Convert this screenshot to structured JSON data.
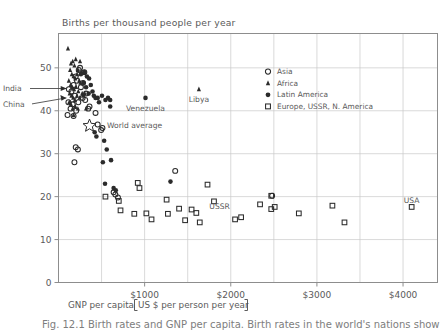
{
  "chart_data": {
    "type": "scatter",
    "title": "Births per thousand people per year",
    "ylabel": "Births per thousand people per year",
    "xlabel": "GNP per capita [US $ per person per year]",
    "xlabel_main": "GNP per capita",
    "xlabel_bracket": "US $ per person per year",
    "xlim": [
      0,
      4400
    ],
    "ylim": [
      0,
      58
    ],
    "grid": true,
    "grid_x_step": 500,
    "grid_y_step": 10,
    "legend_position": "upper-right-inside",
    "xticks": [
      0,
      1000,
      2000,
      3000,
      4000
    ],
    "xtick_labels": [
      "",
      "$1000",
      "$2000",
      "$3000",
      "$4000"
    ],
    "yticks": [
      0,
      10,
      20,
      30,
      40,
      50
    ],
    "ytick_labels": [
      "0",
      "10",
      "20",
      "30",
      "40",
      "50"
    ],
    "legend": [
      {
        "label": "Asia",
        "marker": "open-circle",
        "key": "asia"
      },
      {
        "label": "Africa",
        "marker": "filled-triangle",
        "key": "africa"
      },
      {
        "label": "Latin America",
        "marker": "filled-circle",
        "key": "latin"
      },
      {
        "label": "Europe, USSR, N. America",
        "marker": "open-square",
        "key": "europe"
      }
    ],
    "annotations": [
      {
        "text": "India",
        "x": 120,
        "y": 45.0,
        "kind": "leader-label"
      },
      {
        "text": "China",
        "x": 120,
        "y": 42.0,
        "kind": "leader-label"
      },
      {
        "text": "World average",
        "x": 470,
        "y": 36.5,
        "kind": "star-label"
      },
      {
        "text": "Venezuela",
        "x": 1010,
        "y": 43.0,
        "kind": "point-label"
      },
      {
        "text": "Libya",
        "x": 1630,
        "y": 45.0,
        "kind": "point-label"
      },
      {
        "text": "USSR",
        "x": 1870,
        "y": 17.5,
        "kind": "point-label"
      },
      {
        "text": "USA",
        "x": 4100,
        "y": 17.5,
        "kind": "point-label"
      }
    ],
    "series": [
      {
        "name": "Asia",
        "marker": "open-circle",
        "points": [
          [
            120,
            45.0
          ],
          [
            115,
            42.0
          ],
          [
            150,
            44.5
          ],
          [
            175,
            46.0
          ],
          [
            200,
            48.0
          ],
          [
            235,
            49.5
          ],
          [
            250,
            50.0
          ],
          [
            215,
            47.0
          ],
          [
            190,
            43.5
          ],
          [
            165,
            41.5
          ],
          [
            140,
            40.5
          ],
          [
            105,
            39.0
          ],
          [
            260,
            45.5
          ],
          [
            285,
            46.5
          ],
          [
            300,
            49.0
          ],
          [
            320,
            44.0
          ],
          [
            345,
            40.5
          ],
          [
            360,
            41.0
          ],
          [
            310,
            42.5
          ],
          [
            280,
            43.0
          ],
          [
            230,
            42.0
          ],
          [
            205,
            40.0
          ],
          [
            175,
            38.8
          ],
          [
            430,
            39.5
          ],
          [
            455,
            36.8
          ],
          [
            495,
            35.5
          ],
          [
            200,
            31.5
          ],
          [
            225,
            31.0
          ],
          [
            185,
            28.0
          ],
          [
            640,
            21.0
          ],
          [
            660,
            20.5
          ],
          [
            690,
            19.8
          ],
          [
            1355,
            26.0
          ],
          [
            2480,
            20.2
          ],
          [
            510,
            36.0
          ]
        ]
      },
      {
        "name": "Africa",
        "marker": "filled-triangle",
        "points": [
          [
            110,
            54.5
          ],
          [
            145,
            51.0
          ],
          [
            165,
            51.5
          ],
          [
            185,
            50.5
          ],
          [
            200,
            52.0
          ],
          [
            225,
            49.5
          ],
          [
            250,
            51.5
          ],
          [
            135,
            49.5
          ],
          [
            155,
            48.5
          ],
          [
            175,
            48.0
          ],
          [
            195,
            47.5
          ],
          [
            215,
            48.5
          ],
          [
            240,
            47.0
          ],
          [
            265,
            49.0
          ],
          [
            120,
            47.0
          ],
          [
            140,
            46.0
          ],
          [
            160,
            45.5
          ],
          [
            180,
            45.0
          ],
          [
            205,
            45.5
          ],
          [
            230,
            44.5
          ],
          [
            255,
            46.5
          ],
          [
            130,
            44.0
          ],
          [
            150,
            43.5
          ],
          [
            170,
            43.0
          ],
          [
            190,
            42.5
          ],
          [
            215,
            43.5
          ],
          [
            245,
            43.0
          ],
          [
            275,
            44.0
          ],
          [
            125,
            42.0
          ],
          [
            145,
            41.5
          ],
          [
            165,
            40.5
          ],
          [
            195,
            41.0
          ],
          [
            225,
            40.5
          ],
          [
            285,
            43.5
          ],
          [
            305,
            44.0
          ],
          [
            175,
            39.0
          ],
          [
            320,
            40.5
          ],
          [
            1630,
            45.0
          ]
        ]
      },
      {
        "name": "Latin America",
        "marker": "filled-circle",
        "points": [
          [
            260,
            48.5
          ],
          [
            300,
            49.0
          ],
          [
            330,
            48.0
          ],
          [
            355,
            47.5
          ],
          [
            375,
            46.0
          ],
          [
            395,
            44.5
          ],
          [
            410,
            43.5
          ],
          [
            350,
            44.0
          ],
          [
            320,
            45.5
          ],
          [
            290,
            46.5
          ],
          [
            430,
            43.0
          ],
          [
            455,
            43.0
          ],
          [
            470,
            42.0
          ],
          [
            505,
            43.5
          ],
          [
            545,
            42.5
          ],
          [
            575,
            43.0
          ],
          [
            600,
            42.5
          ],
          [
            600,
            41.0
          ],
          [
            530,
            33.0
          ],
          [
            560,
            31.0
          ],
          [
            515,
            28.0
          ],
          [
            610,
            28.5
          ],
          [
            540,
            23.0
          ],
          [
            640,
            22.0
          ],
          [
            665,
            21.5
          ],
          [
            1300,
            23.5
          ],
          [
            1010,
            43.0
          ],
          [
            420,
            35.0
          ],
          [
            440,
            34.0
          ]
        ]
      },
      {
        "name": "Europe, USSR, N. America",
        "marker": "open-square",
        "points": [
          [
            545,
            20.0
          ],
          [
            700,
            19.0
          ],
          [
            720,
            16.8
          ],
          [
            920,
            23.2
          ],
          [
            940,
            22.0
          ],
          [
            880,
            16.0
          ],
          [
            1020,
            16.1
          ],
          [
            1080,
            14.7
          ],
          [
            1255,
            19.3
          ],
          [
            1270,
            16.0
          ],
          [
            1400,
            17.2
          ],
          [
            1470,
            14.5
          ],
          [
            1545,
            17.0
          ],
          [
            1600,
            16.2
          ],
          [
            1640,
            14.0
          ],
          [
            1730,
            22.8
          ],
          [
            1805,
            18.9
          ],
          [
            2050,
            14.7
          ],
          [
            2120,
            15.2
          ],
          [
            2340,
            18.2
          ],
          [
            2470,
            17.1
          ],
          [
            2510,
            17.6
          ],
          [
            2790,
            16.1
          ],
          [
            3180,
            17.9
          ],
          [
            3320,
            14.0
          ],
          [
            4100,
            17.6
          ],
          [
            2470,
            20.2
          ]
        ]
      }
    ]
  },
  "caption": {
    "text": "Fig. 12.1  Birth rates and GNP per capita. Birth rates in the world's nations show"
  }
}
